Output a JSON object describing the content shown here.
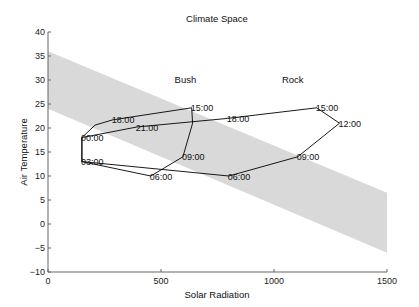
{
  "chart_data": {
    "type": "line",
    "title": "Climate Space",
    "xlabel": "Solar Radiation",
    "ylabel": "Air Temperature",
    "xlim": [
      0,
      1500
    ],
    "ylim": [
      -10,
      40
    ],
    "xticks": [
      0,
      500,
      1000,
      1500
    ],
    "yticks": [
      -10,
      -5,
      0,
      5,
      10,
      15,
      20,
      25,
      30,
      35,
      40
    ],
    "grid": false,
    "legend": null,
    "band": {
      "name": "climate space (shaded)",
      "color": "#d9d9d9",
      "x": [
        0,
        1500
      ],
      "upper": [
        36,
        6.5
      ],
      "lower": [
        24,
        -6
      ]
    },
    "annotations": [
      {
        "text": "Bush",
        "x": 560,
        "y": 30
      },
      {
        "text": "Rock",
        "x": 1035,
        "y": 30
      }
    ],
    "series": [
      {
        "name": "Bush",
        "color": "#000000",
        "points": [
          {
            "label": "00:00",
            "x": 150,
            "y": 18
          },
          {
            "label": "03:00",
            "x": 150,
            "y": 13
          },
          {
            "label": "06:00",
            "x": 455,
            "y": 10
          },
          {
            "label": "09:00",
            "x": 597,
            "y": 14
          },
          {
            "label": "",
            "x": 640,
            "y": 21
          },
          {
            "label": "15:00",
            "x": 636,
            "y": 24.2
          },
          {
            "label": "18:00",
            "x": 287,
            "y": 21.7
          },
          {
            "label": "",
            "x": 208,
            "y": 20.6
          },
          {
            "label": "00:00",
            "x": 150,
            "y": 18
          }
        ]
      },
      {
        "name": "Rock",
        "color": "#000000",
        "points": [
          {
            "label": "00:00",
            "x": 150,
            "y": 18
          },
          {
            "label": "03:00",
            "x": 150,
            "y": 13
          },
          {
            "label": "06:00",
            "x": 800,
            "y": 10
          },
          {
            "label": "09:00",
            "x": 1105,
            "y": 14
          },
          {
            "label": "12:00",
            "x": 1290,
            "y": 21
          },
          {
            "label": "15:00",
            "x": 1189,
            "y": 24.2
          },
          {
            "label": "18:00",
            "x": 795,
            "y": 22
          },
          {
            "label": "21:00",
            "x": 393,
            "y": 20.2
          },
          {
            "label": "00:00",
            "x": 150,
            "y": 18
          }
        ]
      }
    ],
    "labels": [
      {
        "text": "00:00",
        "series": "shared",
        "x": 150,
        "y": 18
      },
      {
        "text": "03:00",
        "series": "shared",
        "x": 150,
        "y": 13
      },
      {
        "text": "06:00",
        "series": "Bush",
        "x": 455,
        "y": 10
      },
      {
        "text": "09:00",
        "series": "Bush",
        "x": 597,
        "y": 14
      },
      {
        "text": "15:00",
        "series": "Bush",
        "x": 636,
        "y": 24.2
      },
      {
        "text": "18:00",
        "series": "Bush",
        "x": 287,
        "y": 21.7
      },
      {
        "text": "21:00",
        "series": "Rock",
        "x": 393,
        "y": 20.2
      },
      {
        "text": "18:00",
        "series": "Rock",
        "x": 795,
        "y": 22
      },
      {
        "text": "15:00",
        "series": "Rock",
        "x": 1189,
        "y": 24.2
      },
      {
        "text": "12:00",
        "series": "Rock",
        "x": 1290,
        "y": 21
      },
      {
        "text": "09:00",
        "series": "Rock",
        "x": 1105,
        "y": 14
      },
      {
        "text": "06:00",
        "series": "Rock",
        "x": 800,
        "y": 10
      }
    ]
  }
}
